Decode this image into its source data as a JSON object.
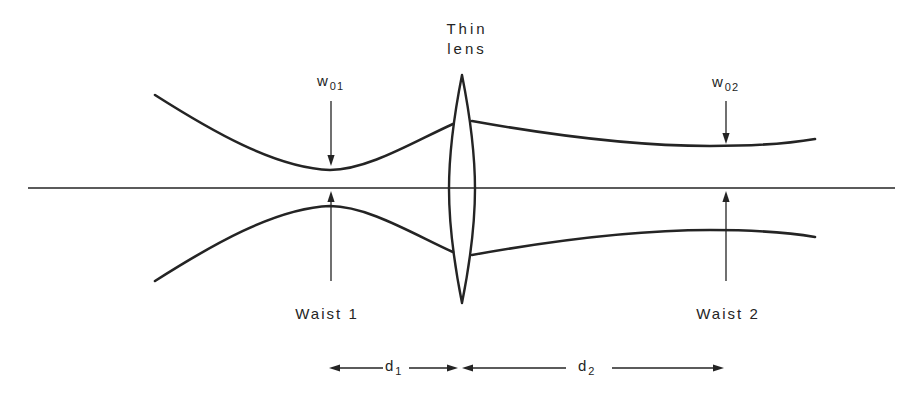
{
  "figure": {
    "colors": {
      "line": "#242424",
      "background": "#ffffff"
    },
    "labels": {
      "thin_lens_line1": "Thin",
      "thin_lens_line2": "lens",
      "w01": {
        "base": "w",
        "sub": "01"
      },
      "w02": {
        "base": "w",
        "sub": "02"
      },
      "waist1": "Waist 1",
      "waist2": "Waist 2",
      "d1": {
        "base": "d",
        "sub": "1"
      },
      "d2": {
        "base": "d",
        "sub": "2"
      }
    }
  }
}
